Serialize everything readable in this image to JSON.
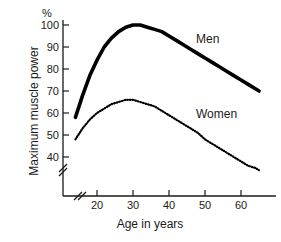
{
  "chart_data": {
    "type": "line",
    "title": "",
    "xlabel": "Age in years",
    "ylabel": "Maximum muscle power",
    "yunit": "%",
    "xlim": [
      13,
      66
    ],
    "ylim": [
      33,
      104
    ],
    "grid": false,
    "legend_position": "inline-right",
    "axis_breaks": {
      "y_break": true,
      "x_break": true,
      "note": "diagonal double-slash break marks near both axis origins"
    },
    "xticks": [
      20,
      30,
      40,
      50,
      60
    ],
    "xtick_labels": [
      "20",
      "30",
      "40",
      "50",
      "60"
    ],
    "yticks": [
      40,
      50,
      60,
      70,
      80,
      90,
      100
    ],
    "ytick_labels": [
      "40",
      "50",
      "60",
      "70",
      "80",
      "90",
      "100"
    ],
    "series": [
      {
        "name": "Men",
        "style": "solid-thick",
        "color": "#000000",
        "x": [
          14,
          16,
          18,
          20,
          22,
          24,
          26,
          28,
          30,
          32,
          34,
          36,
          38,
          40,
          42,
          44,
          46,
          48,
          50,
          52,
          54,
          56,
          58,
          60,
          62,
          64,
          65
        ],
        "values": [
          58,
          68,
          77,
          84,
          90,
          94,
          97,
          99,
          100,
          100,
          99,
          98,
          97,
          95,
          93,
          91,
          89,
          87,
          85,
          83,
          81,
          79,
          77,
          75,
          73,
          71,
          70
        ]
      },
      {
        "name": "Women",
        "style": "dotted",
        "color": "#000000",
        "x": [
          14,
          16,
          18,
          20,
          22,
          24,
          26,
          28,
          30,
          32,
          34,
          36,
          38,
          40,
          42,
          44,
          46,
          48,
          50,
          52,
          54,
          56,
          58,
          60,
          62,
          64,
          65
        ],
        "values": [
          48,
          53,
          57,
          60,
          62,
          64,
          65,
          66,
          66,
          65,
          64,
          63,
          61,
          59,
          57,
          55,
          53,
          51,
          48,
          46,
          44,
          42,
          40,
          38,
          36,
          35,
          34
        ]
      }
    ],
    "annotations": [
      {
        "text": "Men",
        "x": 55,
        "y": 97
      },
      {
        "text": "Women",
        "x": 55,
        "y": 62
      }
    ]
  }
}
